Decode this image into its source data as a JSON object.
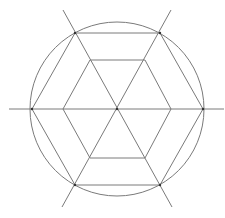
{
  "diagram": {
    "type": "geometric-construction",
    "stroke_color": "#7a7a7a",
    "vertex_color": "#333333",
    "center": [
      117,
      109
    ],
    "circle": {
      "cx": 117,
      "cy": 109,
      "r": 87
    },
    "outer_hexagon": [
      [
        32,
        109
      ],
      [
        75,
        33
      ],
      [
        160,
        33
      ],
      [
        203,
        109
      ],
      [
        160,
        185
      ],
      [
        75,
        185
      ]
    ],
    "inner_hexagon": [
      [
        63,
        109
      ],
      [
        90,
        60
      ],
      [
        145,
        60
      ],
      [
        171,
        109
      ],
      [
        145,
        158
      ],
      [
        90,
        158
      ]
    ],
    "lines": [
      {
        "name": "horizontal-axis",
        "from": [
          9,
          109
        ],
        "to": [
          224,
          109
        ]
      },
      {
        "name": "diagonal-axis-1",
        "from": [
          63,
          10
        ],
        "to": [
          172,
          207
        ]
      },
      {
        "name": "diagonal-axis-2",
        "from": [
          171,
          10
        ],
        "to": [
          62,
          207
        ]
      }
    ],
    "vertices": [
      [
        32,
        109
      ],
      [
        75,
        33
      ],
      [
        160,
        33
      ],
      [
        203,
        109
      ],
      [
        160,
        185
      ],
      [
        75,
        185
      ],
      [
        117,
        109
      ]
    ]
  }
}
